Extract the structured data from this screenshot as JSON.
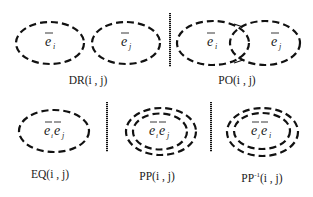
{
  "diagram": {
    "type": "spatial-relations",
    "stroke_color": "#111111",
    "background": "#ffffff",
    "panels": [
      {
        "id": "DR",
        "label": "DR(i , j)",
        "meaning": "disjoint",
        "ellipses": [
          {
            "symbol_base": "e",
            "subscript": "i"
          },
          {
            "symbol_base": "e",
            "subscript": "j"
          }
        ]
      },
      {
        "id": "PO",
        "label": "PO(i , j)",
        "meaning": "partial overlap",
        "ellipses": [
          {
            "symbol_base": "e",
            "subscript": "i"
          },
          {
            "symbol_base": "e",
            "subscript": "j"
          }
        ]
      },
      {
        "id": "EQ",
        "label": "EQ(i , j)",
        "meaning": "equal",
        "ellipses": [
          {
            "symbol_base": "e",
            "subscript": "i"
          },
          {
            "symbol_base": "e",
            "subscript": "j"
          }
        ]
      },
      {
        "id": "PP",
        "label": "PP(i , j)",
        "meaning": "proper part",
        "ellipses": [
          {
            "symbol_base": "e",
            "subscript": "i"
          },
          {
            "symbol_base": "e",
            "subscript": "j"
          }
        ]
      },
      {
        "id": "PPi",
        "label_base": "PP",
        "label_sup": "-1",
        "label_args": "(i , j)",
        "meaning": "inverse proper part",
        "ellipses": [
          {
            "symbol_base": "e",
            "subscript": "j"
          },
          {
            "symbol_base": "e",
            "subscript": "i"
          }
        ]
      }
    ]
  }
}
